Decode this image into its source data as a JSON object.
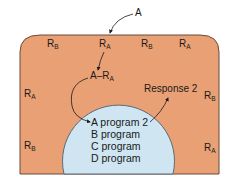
{
  "colors": {
    "cell_fill": "#e9a074",
    "cell_border": "#6b4a3a",
    "nucleus_fill": "#cfe6f2",
    "nucleus_border": "#5a6a78",
    "text": "#1a1a1a"
  },
  "ligand": {
    "label": "A"
  },
  "complex": {
    "base": "A–R",
    "sub": "A"
  },
  "receptors": [
    {
      "base": "R",
      "sub": "B",
      "pos": "top-1"
    },
    {
      "base": "R",
      "sub": "A",
      "pos": "top-2"
    },
    {
      "base": "R",
      "sub": "B",
      "pos": "top-3"
    },
    {
      "base": "R",
      "sub": "A",
      "pos": "top-4"
    },
    {
      "base": "R",
      "sub": "A",
      "pos": "left-upper"
    },
    {
      "base": "R",
      "sub": "B",
      "pos": "left-lower"
    },
    {
      "base": "R",
      "sub": "B",
      "pos": "right-upper"
    },
    {
      "base": "R",
      "sub": "A",
      "pos": "right-lower"
    }
  ],
  "response": {
    "label": "Response 2"
  },
  "programs": [
    {
      "label": "A program 2"
    },
    {
      "label": "B program"
    },
    {
      "label": "C program"
    },
    {
      "label": "D program"
    }
  ]
}
